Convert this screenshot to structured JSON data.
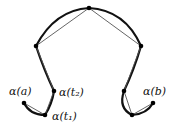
{
  "diagram": {
    "points": [
      {
        "id": "a",
        "x": 24,
        "y": 103
      },
      {
        "id": "t1",
        "x": 45,
        "y": 115
      },
      {
        "id": "t2",
        "x": 54,
        "y": 91
      },
      {
        "id": "p3",
        "x": 36,
        "y": 46
      },
      {
        "id": "p4",
        "x": 89,
        "y": 8
      },
      {
        "id": "p5",
        "x": 141,
        "y": 46
      },
      {
        "id": "p6",
        "x": 124,
        "y": 91
      },
      {
        "id": "p7",
        "x": 132,
        "y": 115
      },
      {
        "id": "b",
        "x": 153,
        "y": 103
      }
    ],
    "labels": {
      "alpha_a": "α(a)",
      "alpha_t2": "α(t₂)",
      "alpha_t1": "α(t₁)",
      "alpha_b": "α(b)"
    },
    "colors": {
      "curve": "#111111",
      "chord": "#555555",
      "point": "#000000"
    }
  }
}
